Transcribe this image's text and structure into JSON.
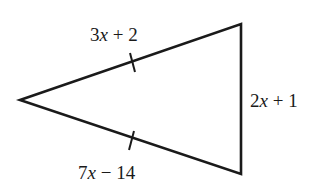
{
  "diagram": {
    "type": "triangle",
    "vertices": {
      "left": [
        20,
        100
      ],
      "top_right": [
        241,
        24
      ],
      "bottom_right": [
        241,
        174
      ]
    },
    "sides": [
      {
        "id": "upper",
        "coef": "3",
        "var": "x",
        "rest": " + 2",
        "full": "3x + 2",
        "tick_mark": true
      },
      {
        "id": "right",
        "coef": "2",
        "var": "x",
        "rest": " + 1",
        "full": "2x + 1",
        "tick_mark": false
      },
      {
        "id": "lower",
        "coef": "7",
        "var": "x",
        "rest": " − 14",
        "full": "7x − 14",
        "tick_mark": true
      }
    ],
    "stroke_color": "#1a1a1a",
    "note": "Congruence tick marks indicate upper and lower sides are equal"
  }
}
